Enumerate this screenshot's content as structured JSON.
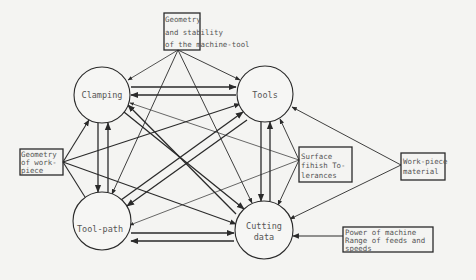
{
  "nodes": {
    "clamping": {
      "label": "Clamping",
      "cx": 102,
      "cy": 95,
      "r": 28
    },
    "tools": {
      "label": "Tools",
      "cx": 265,
      "cy": 94,
      "r": 28
    },
    "tool_path": {
      "label": "Tool-path",
      "cx": 102,
      "cy": 221,
      "r": 29
    },
    "cutting_data": {
      "label": "Cutting data",
      "line1": "Cutting",
      "line2": "data",
      "cx": 264,
      "cy": 230,
      "r": 29
    }
  },
  "boxes": {
    "machine_tool": {
      "lines": [
        "Geometry",
        "and stability",
        "of the machine-tool"
      ]
    },
    "workpiece_geometry": {
      "lines": [
        "Geometry",
        "of work-",
        "piece"
      ]
    },
    "surface_finish": {
      "lines": [
        "Surface",
        "fihish To-",
        "lerances"
      ]
    },
    "workpiece_material": {
      "lines": [
        "Work-piece",
        "material"
      ]
    },
    "power": {
      "lines": [
        "Power of machine",
        "Range of feeds and",
        "speeds"
      ]
    }
  },
  "colors": {
    "line": "#2a2a2a",
    "text": "#555555",
    "background": "#f4f4f2"
  }
}
